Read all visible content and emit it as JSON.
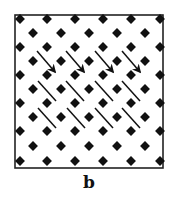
{
  "figure": {
    "label": "b",
    "colors": {
      "ink": "#111111",
      "background": "#ffffff"
    },
    "frame": {
      "x": 15,
      "y": 15,
      "width": 148,
      "height": 153
    },
    "lattice": {
      "even_rows_y": [
        19,
        47,
        75,
        103,
        131,
        161
      ],
      "even_cols_x": [
        20,
        47,
        75,
        103,
        131,
        160
      ],
      "odd_rows_y": [
        33,
        61,
        89,
        117,
        146
      ],
      "odd_cols_x": [
        33,
        61,
        89,
        117,
        145
      ],
      "dot_size": 7
    },
    "diagonal_rows": [
      {
        "arrowheads": true,
        "segments": [
          [
            37,
            51,
            55,
            72
          ],
          [
            66,
            51,
            84,
            72
          ],
          [
            95,
            51,
            113,
            72
          ],
          [
            122,
            51,
            140,
            72
          ]
        ]
      },
      {
        "arrowheads": false,
        "segments": [
          [
            38,
            81,
            56,
            101
          ],
          [
            66,
            81,
            84,
            101
          ],
          [
            95,
            81,
            113,
            101
          ],
          [
            122,
            81,
            140,
            101
          ]
        ]
      },
      {
        "arrowheads": false,
        "segments": [
          [
            38,
            108,
            56,
            128
          ],
          [
            67,
            108,
            85,
            128
          ],
          [
            95,
            108,
            113,
            128
          ],
          [
            122,
            108,
            140,
            128
          ]
        ]
      }
    ]
  }
}
